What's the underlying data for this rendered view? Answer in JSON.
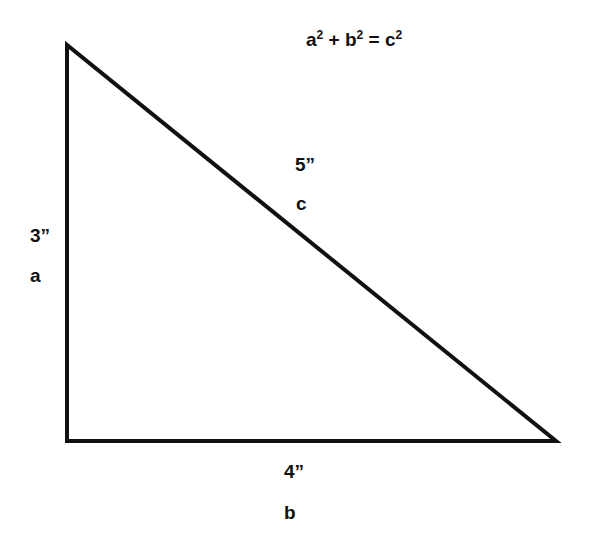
{
  "diagram": {
    "formula": {
      "a": "a",
      "b": "b",
      "c": "c",
      "exp": "2",
      "plus": " + ",
      "equals": " = "
    },
    "vertices": {
      "top_left": [
        67,
        45
      ],
      "bottom_left": [
        67,
        441
      ],
      "bottom_right": [
        556,
        441
      ]
    },
    "stroke_color": "#111111",
    "stroke_width": 4,
    "sides": {
      "a": {
        "length_label": "3”",
        "name": "a"
      },
      "b": {
        "length_label": "4”",
        "name": "b"
      },
      "c": {
        "length_label": "5”",
        "name": "c"
      }
    }
  }
}
